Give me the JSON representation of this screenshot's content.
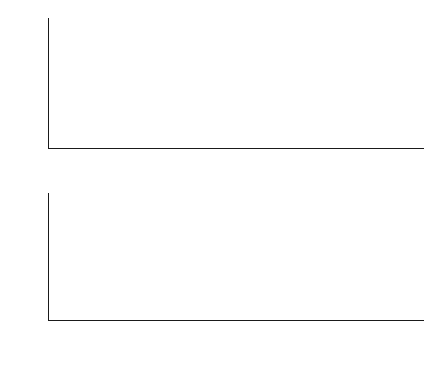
{
  "figure": {
    "caption": "图 三容水箱液位控制系统响应曲线"
  },
  "chart_data": [
    {
      "type": "line",
      "id": "process-input",
      "title": "",
      "xlabel": "Time(s)",
      "ylabel": "Process input(cm3/s)",
      "ylabel_base": "Process input(cm",
      "ylabel_sup": "3",
      "ylabel_tail": "/s)",
      "xlim": [
        0,
        820
      ],
      "ylim": [
        0,
        112
      ],
      "grid": false,
      "legend": "none",
      "xticks": [
        0,
        100,
        200,
        300,
        400,
        500,
        600,
        700,
        800
      ],
      "xtick_labels": [
        "0",
        "100",
        "200",
        "300",
        "400",
        "500",
        "600",
        "700",
        "800"
      ],
      "yticks": [
        50,
        100
      ],
      "ytick_labels": [
        "50",
        "100"
      ],
      "series": [
        {
          "name": "process input",
          "color": "#111111",
          "x": [
            0,
            20,
            40,
            60,
            80,
            100,
            120,
            140,
            160,
            180,
            200,
            215,
            228,
            230,
            232,
            234,
            236,
            240,
            245,
            250,
            256,
            262,
            268,
            275,
            282,
            290,
            298,
            306,
            315,
            325,
            335,
            345,
            355,
            365,
            375,
            385,
            395,
            410,
            425,
            440,
            460,
            480,
            500,
            520,
            545,
            570,
            600,
            640,
            680,
            720,
            760,
            800
          ],
          "y": [
            85.0,
            84.2,
            83.4,
            82.6,
            81.9,
            81.1,
            80.4,
            79.7,
            79.0,
            78.4,
            77.8,
            77.3,
            77.0,
            83.5,
            80.0,
            76.0,
            72.0,
            65.5,
            58.5,
            52.0,
            45.5,
            39.8,
            34.8,
            29.8,
            25.4,
            21.2,
            17.8,
            15.0,
            12.4,
            10.2,
            8.6,
            7.4,
            6.4,
            5.6,
            5.0,
            4.5,
            4.2,
            3.8,
            3.5,
            3.3,
            3.1,
            3.0,
            2.9,
            2.85,
            2.8,
            2.78,
            2.75,
            2.72,
            2.7,
            2.68,
            2.66,
            2.65
          ]
        }
      ]
    },
    {
      "type": "line",
      "id": "process-output",
      "title": "",
      "xlabel": "Time(s)",
      "ylabel": "Process output(cm)",
      "xlim": [
        0,
        820
      ],
      "ylim": [
        0,
        57
      ],
      "grid": false,
      "legend": "none",
      "xticks": [
        0,
        100,
        200,
        300,
        400,
        500,
        600,
        700,
        800
      ],
      "xtick_labels": [
        "0",
        "100",
        "200",
        "300",
        "400",
        "500",
        "600",
        "700",
        "800"
      ],
      "yticks": [
        10,
        20,
        30,
        40,
        50
      ],
      "ytick_labels": [
        "10",
        "20",
        "30",
        "40",
        "50"
      ],
      "series": [
        {
          "name": "process output",
          "color": "#111111",
          "x": [
            0,
            20,
            40,
            60,
            80,
            100,
            120,
            140,
            160,
            180,
            200,
            220,
            240,
            255,
            270,
            282,
            292,
            302,
            312,
            322,
            335,
            350,
            370,
            400,
            440,
            480,
            520,
            560,
            600,
            650,
            700,
            750,
            800
          ],
          "y": [
            0.4,
            2.5,
            4.7,
            6.9,
            9.1,
            11.3,
            13.5,
            15.7,
            17.9,
            20.0,
            22.0,
            23.9,
            25.6,
            26.7,
            27.8,
            28.6,
            29.1,
            29.5,
            29.8,
            30.0,
            30.2,
            30.3,
            30.4,
            30.45,
            30.5,
            30.5,
            30.5,
            30.5,
            30.5,
            30.5,
            30.5,
            30.5,
            30.5
          ]
        }
      ]
    }
  ]
}
